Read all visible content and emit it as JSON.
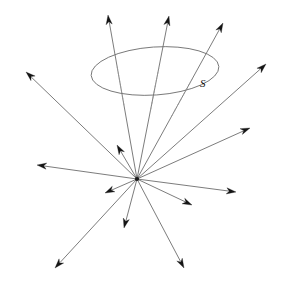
{
  "figure": {
    "background_color": "#ffffff",
    "width": 283,
    "height": 284,
    "labels": {
      "surface": "S"
    },
    "colors": {
      "ray_stroke": "#5a5a5a",
      "hidden_ray_stroke": "#9a9a9a",
      "arrow_fill": "#151515",
      "surface_stroke": "#6e6e6e",
      "vertex_fill": "#1a1a1a",
      "label_fill": "#101010"
    },
    "vertex": {
      "x": 137,
      "y": 179
    },
    "surface": {
      "name": "S",
      "shape": "ellipse",
      "cx": 155,
      "cy": 71,
      "rx": 64,
      "ry": 24,
      "rotation_deg": -4,
      "label_x": 200,
      "label_y": 87
    },
    "label_positions": [
      {
        "text": "S",
        "x": 200,
        "y": 87
      }
    ],
    "rays": [
      {
        "id": "ray-up-left",
        "tip_x": 108,
        "tip_y": 15,
        "head_angle_deg": -97,
        "hidden_from": 0.3,
        "hidden_to": 0.55
      },
      {
        "id": "ray-up-center",
        "tip_x": 169,
        "tip_y": 16,
        "head_angle_deg": -77,
        "hidden_from": 0.32,
        "hidden_to": 0.58
      },
      {
        "id": "ray-up-right",
        "tip_x": 223,
        "tip_y": 23,
        "head_angle_deg": -62,
        "hidden_from": 0.36,
        "hidden_to": 0.6
      },
      {
        "id": "ray-right-upper",
        "tip_x": 266,
        "tip_y": 64,
        "head_angle_deg": -43,
        "hidden_from": 0,
        "hidden_to": 0
      },
      {
        "id": "ray-right-mid",
        "tip_x": 250,
        "tip_y": 128,
        "head_angle_deg": -22,
        "hidden_from": 0,
        "hidden_to": 0
      },
      {
        "id": "ray-right-low",
        "tip_x": 236,
        "tip_y": 192,
        "head_angle_deg": 7,
        "hidden_from": 0,
        "hidden_to": 0
      },
      {
        "id": "ray-right-down",
        "tip_x": 192,
        "tip_y": 205,
        "head_angle_deg": 25,
        "hidden_from": 0,
        "hidden_to": 0
      },
      {
        "id": "ray-down-right",
        "tip_x": 184,
        "tip_y": 268,
        "head_angle_deg": 62,
        "hidden_from": 0,
        "hidden_to": 0
      },
      {
        "id": "ray-down-center",
        "tip_x": 124,
        "tip_y": 228,
        "head_angle_deg": 104,
        "hidden_from": 0,
        "hidden_to": 0
      },
      {
        "id": "ray-down-left",
        "tip_x": 55,
        "tip_y": 268,
        "head_angle_deg": 132,
        "hidden_from": 0,
        "hidden_to": 0
      },
      {
        "id": "ray-left-low",
        "tip_x": 105,
        "tip_y": 193,
        "head_angle_deg": 155,
        "hidden_from": 0,
        "hidden_to": 0
      },
      {
        "id": "ray-left-mid",
        "tip_x": 37,
        "tip_y": 165,
        "head_angle_deg": 187,
        "hidden_from": 0,
        "hidden_to": 0
      },
      {
        "id": "ray-left-upper",
        "tip_x": 26,
        "tip_y": 72,
        "head_angle_deg": 222,
        "hidden_from": 0,
        "hidden_to": 0
      },
      {
        "id": "ray-up-left-short",
        "tip_x": 117,
        "tip_y": 145,
        "head_angle_deg": 240,
        "hidden_from": 0,
        "hidden_to": 0
      }
    ]
  }
}
